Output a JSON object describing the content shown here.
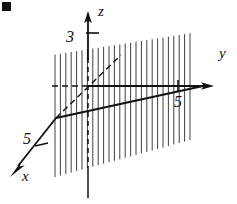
{
  "figure": {
    "kind": "3d-coordinate-plane-diagram",
    "background_color": "#ffffff",
    "ink_color": "#111111",
    "width": 237,
    "height": 204,
    "axes": [
      {
        "id": "z",
        "label": "z",
        "label_position": {
          "x": 98,
          "y": 16
        },
        "direction": "up",
        "tick": {
          "value": "3",
          "label_position": {
            "x": 70,
            "y": 42
          }
        }
      },
      {
        "id": "y",
        "label": "y",
        "label_position": {
          "x": 219,
          "y": 58
        },
        "direction": "right",
        "tick": {
          "value": "5",
          "label_position": {
            "x": 170,
            "y": 107
          }
        }
      },
      {
        "id": "x",
        "label": "x",
        "label_position": {
          "x": 22,
          "y": 180
        },
        "direction": "down-left",
        "tick": {
          "value": "5",
          "label_position": {
            "x": 16,
            "y": 148
          }
        }
      }
    ],
    "plane": {
      "description": "vertical hatched plane",
      "hatch_line_count": 26,
      "hatch_orientation": "vertical"
    },
    "lines": [
      {
        "id": "solid-line-in-plane",
        "style": "solid",
        "weight": "thick"
      },
      {
        "id": "dashed-diagonal-line",
        "style": "dashed"
      },
      {
        "id": "dashed-horizontal-line",
        "style": "dashed"
      },
      {
        "id": "dashed-z-axis-through-plane",
        "style": "dashed"
      }
    ],
    "corner_mark": {
      "id": "corner-artifact",
      "x": 2,
      "y": 2,
      "size": 9
    }
  }
}
